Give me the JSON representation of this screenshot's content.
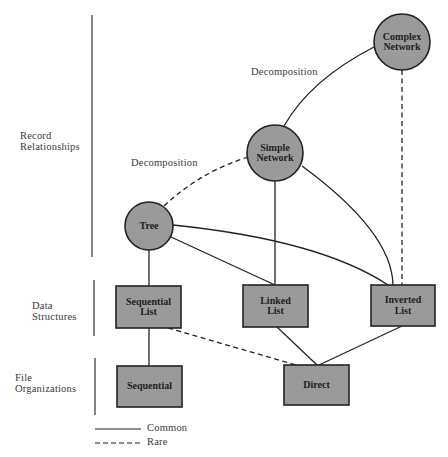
{
  "colors": {
    "node_fill": "#9a9a9a",
    "stroke": "#222222",
    "background": "#ffffff",
    "text": "#3a3a3a"
  },
  "tiers": [
    {
      "label_line1": "Record",
      "label_line2": "Relationships"
    },
    {
      "label_line1": "Data",
      "label_line2": "Structures"
    },
    {
      "label_line1": "File",
      "label_line2": "Organizations"
    }
  ],
  "edge_labels": {
    "upper_decomposition": "Decomposition",
    "lower_decomposition": "Decomposition"
  },
  "nodes": {
    "complex_network": {
      "line1": "Complex",
      "line2": "Network",
      "shape": "circle"
    },
    "simple_network": {
      "line1": "Simple",
      "line2": "Network",
      "shape": "circle"
    },
    "tree": {
      "line1": "Tree",
      "shape": "circle"
    },
    "sequential_list": {
      "line1": "Sequential",
      "line2": "List",
      "shape": "box"
    },
    "linked_list": {
      "line1": "Linked",
      "line2": "List",
      "shape": "box"
    },
    "inverted_list": {
      "line1": "Inverted",
      "line2": "List",
      "shape": "box"
    },
    "sequential": {
      "line1": "Sequential",
      "shape": "box"
    },
    "direct": {
      "line1": "Direct",
      "shape": "box"
    }
  },
  "edges": [
    {
      "from": "simple_network",
      "to": "complex_network",
      "style": "solid",
      "label": "Decomposition"
    },
    {
      "from": "tree",
      "to": "simple_network",
      "style": "dashed",
      "label": "Decomposition"
    },
    {
      "from": "complex_network",
      "to": "inverted_list",
      "style": "dashed"
    },
    {
      "from": "simple_network",
      "to": "linked_list",
      "style": "solid"
    },
    {
      "from": "simple_network",
      "to": "inverted_list",
      "style": "solid"
    },
    {
      "from": "tree",
      "to": "sequential_list",
      "style": "solid"
    },
    {
      "from": "tree",
      "to": "linked_list",
      "style": "solid"
    },
    {
      "from": "tree",
      "to": "inverted_list",
      "style": "solid"
    },
    {
      "from": "sequential_list",
      "to": "sequential",
      "style": "solid"
    },
    {
      "from": "sequential_list",
      "to": "direct",
      "style": "dashed"
    },
    {
      "from": "linked_list",
      "to": "direct",
      "style": "solid"
    },
    {
      "from": "inverted_list",
      "to": "direct",
      "style": "solid"
    }
  ],
  "legend": {
    "common": "Common",
    "rare": "Rare"
  }
}
